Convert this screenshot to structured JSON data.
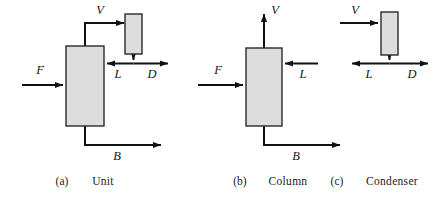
{
  "figure": {
    "background_color": "#ffffff",
    "box_fill_color": "#dddddd",
    "box_stroke_color": "#2a2a2a",
    "line_color": "#111111",
    "panels": [
      {
        "id": "a",
        "tag": "(a)",
        "caption": "Unit",
        "blocks": [
          {
            "name": "column-block",
            "label": ""
          },
          {
            "name": "condenser-block",
            "label": ""
          }
        ],
        "stream_labels": [
          {
            "name": "stream-label-F",
            "text": "F"
          },
          {
            "name": "stream-label-V",
            "text": "V"
          },
          {
            "name": "stream-label-L",
            "text": "L"
          },
          {
            "name": "stream-label-D",
            "text": "D"
          },
          {
            "name": "stream-label-B",
            "text": "B"
          }
        ]
      },
      {
        "id": "b",
        "tag": "(b)",
        "caption": "Column",
        "blocks": [
          {
            "name": "column-block",
            "label": ""
          }
        ],
        "stream_labels": [
          {
            "name": "stream-label-F",
            "text": "F"
          },
          {
            "name": "stream-label-V",
            "text": "V"
          },
          {
            "name": "stream-label-L",
            "text": "L"
          },
          {
            "name": "stream-label-B",
            "text": "B"
          }
        ]
      },
      {
        "id": "c",
        "tag": "(c)",
        "caption": "Condenser",
        "blocks": [
          {
            "name": "condenser-block",
            "label": ""
          }
        ],
        "stream_labels": [
          {
            "name": "stream-label-V",
            "text": "V"
          },
          {
            "name": "stream-label-L",
            "text": "L"
          },
          {
            "name": "stream-label-D",
            "text": "D"
          }
        ]
      }
    ]
  }
}
